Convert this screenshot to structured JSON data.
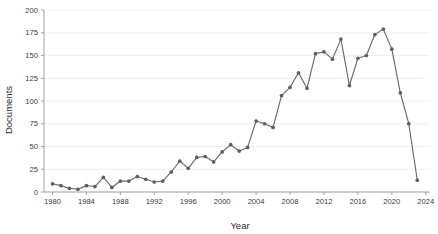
{
  "chart_data": {
    "type": "line",
    "title": "",
    "xlabel": "Year",
    "ylabel": "Documents",
    "xlim": [
      1979,
      2024.5
    ],
    "ylim": [
      0,
      200
    ],
    "grid": true,
    "legend": false,
    "legend_position": "none",
    "line_color": "#6b6b6b",
    "marker_color": "#5f5f5f",
    "marker_shape": "circle",
    "x_tick_labels": [
      "1980",
      "1984",
      "1988",
      "1992",
      "1996",
      "2000",
      "2004",
      "2008",
      "2012",
      "2016",
      "2020",
      "2024"
    ],
    "x_tick_values": [
      1980,
      1984,
      1988,
      1992,
      1996,
      2000,
      2004,
      2008,
      2012,
      2016,
      2020,
      2024
    ],
    "y_tick_labels": [
      "0",
      "25",
      "50",
      "75",
      "100",
      "125",
      "150",
      "175",
      "200"
    ],
    "y_tick_values": [
      0,
      25,
      50,
      75,
      100,
      125,
      150,
      175,
      200
    ],
    "x": [
      1980,
      1981,
      1982,
      1983,
      1984,
      1985,
      1986,
      1987,
      1988,
      1989,
      1990,
      1991,
      1992,
      1993,
      1994,
      1995,
      1996,
      1997,
      1998,
      1999,
      2000,
      2001,
      2002,
      2003,
      2004,
      2005,
      2006,
      2007,
      2008,
      2009,
      2010,
      2011,
      2012,
      2013,
      2014,
      2015,
      2016,
      2017,
      2018,
      2019,
      2020,
      2021,
      2022,
      2023
    ],
    "values": [
      9,
      7,
      4,
      3,
      7,
      6,
      16,
      5,
      12,
      12,
      17,
      14,
      11,
      12,
      22,
      34,
      26,
      38,
      39,
      33,
      44,
      52,
      45,
      49,
      78,
      75,
      71,
      106,
      115,
      131,
      114,
      152,
      154,
      146,
      168,
      117,
      147,
      150,
      173,
      179,
      157,
      109,
      75,
      13
    ],
    "series": [
      {
        "name": "Documents",
        "values": [
          9,
          7,
          4,
          3,
          7,
          6,
          16,
          5,
          12,
          12,
          17,
          14,
          11,
          12,
          22,
          34,
          26,
          38,
          39,
          33,
          44,
          52,
          45,
          49,
          78,
          75,
          71,
          106,
          115,
          131,
          114,
          152,
          154,
          146,
          168,
          117,
          147,
          150,
          173,
          179,
          157,
          109,
          75,
          13
        ]
      }
    ]
  }
}
